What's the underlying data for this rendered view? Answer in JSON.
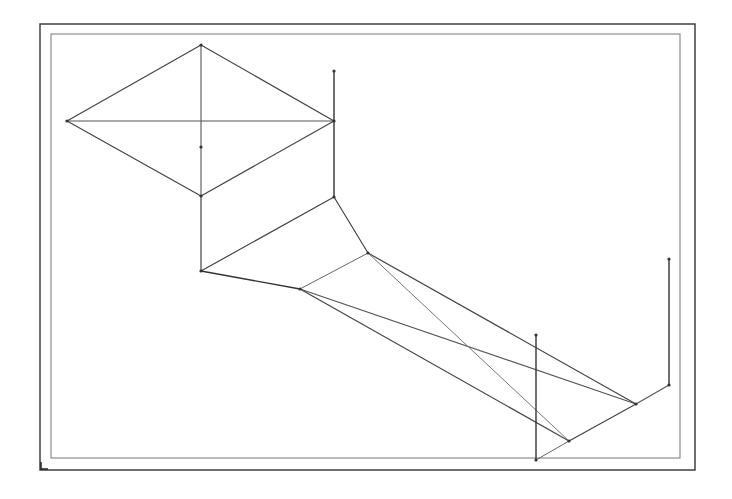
{
  "diagram": {
    "type": "line-drawing",
    "frames": {
      "outer": {
        "x1": 40,
        "y1": 24,
        "x2": 695,
        "y2": 470,
        "stroke": "#333333",
        "width": 1.4
      },
      "inner": {
        "x1": 51,
        "y1": 34,
        "x2": 680,
        "y2": 458,
        "stroke": "#777777",
        "width": 1
      }
    },
    "nodes": [
      {
        "id": "diamond-left",
        "x": 67,
        "y": 121
      },
      {
        "id": "diamond-top",
        "x": 201,
        "y": 45
      },
      {
        "id": "diamond-right",
        "x": 334,
        "y": 121
      },
      {
        "id": "diamond-bottom",
        "x": 201,
        "y": 196
      },
      {
        "id": "diamond-center",
        "x": 201,
        "y": 147
      },
      {
        "id": "post-top",
        "x": 334,
        "y": 71
      },
      {
        "id": "post-bottom",
        "x": 334,
        "y": 197
      },
      {
        "id": "node-a",
        "x": 201,
        "y": 271
      },
      {
        "id": "node-b",
        "x": 300,
        "y": 289
      },
      {
        "id": "node-d",
        "x": 368,
        "y": 253
      },
      {
        "id": "node-e",
        "x": 536,
        "y": 335
      },
      {
        "id": "node-f",
        "x": 536,
        "y": 460
      },
      {
        "id": "node-g",
        "x": 569,
        "y": 441
      },
      {
        "id": "node-h",
        "x": 636,
        "y": 404
      },
      {
        "id": "node-i",
        "x": 669,
        "y": 385
      },
      {
        "id": "node-j",
        "x": 669,
        "y": 259
      }
    ],
    "edges": [
      {
        "from": "diamond-left",
        "to": "diamond-top",
        "stroke": "#444444",
        "width": 1.2
      },
      {
        "from": "diamond-top",
        "to": "diamond-right",
        "stroke": "#444444",
        "width": 1.2
      },
      {
        "from": "diamond-right",
        "to": "diamond-bottom",
        "stroke": "#444444",
        "width": 1.2
      },
      {
        "from": "diamond-bottom",
        "to": "diamond-left",
        "stroke": "#444444",
        "width": 1.2
      },
      {
        "from": "diamond-left",
        "to": "diamond-right",
        "stroke": "#555555",
        "width": 1.1
      },
      {
        "from": "diamond-top",
        "to": "diamond-bottom",
        "stroke": "#555555",
        "width": 1.1
      },
      {
        "from": "post-top",
        "to": "post-bottom",
        "stroke": "#333333",
        "width": 1.4
      },
      {
        "from": "diamond-bottom",
        "to": "node-a",
        "stroke": "#444444",
        "width": 1.2
      },
      {
        "from": "node-a",
        "to": "post-bottom",
        "stroke": "#444444",
        "width": 1.2
      },
      {
        "from": "post-bottom",
        "to": "node-d",
        "stroke": "#444444",
        "width": 1.2
      },
      {
        "from": "node-a",
        "to": "node-b",
        "stroke": "#333333",
        "width": 1.4
      },
      {
        "from": "node-b",
        "to": "node-d",
        "stroke": "#666666",
        "width": 1
      },
      {
        "from": "node-b",
        "to": "node-h",
        "stroke": "#555555",
        "width": 1.1
      },
      {
        "from": "node-b",
        "to": "node-g",
        "stroke": "#444444",
        "width": 1.2
      },
      {
        "from": "node-d",
        "to": "node-h",
        "stroke": "#444444",
        "width": 1.2
      },
      {
        "from": "node-d",
        "to": "node-g",
        "stroke": "#777777",
        "width": 1
      },
      {
        "from": "node-f",
        "to": "node-g",
        "stroke": "#666666",
        "width": 1
      },
      {
        "from": "node-g",
        "to": "node-h",
        "stroke": "#444444",
        "width": 1.2
      },
      {
        "from": "node-h",
        "to": "node-i",
        "stroke": "#555555",
        "width": 1.1
      },
      {
        "from": "node-i",
        "to": "node-j",
        "stroke": "#333333",
        "width": 1.4
      },
      {
        "from": "node-e",
        "to": "node-f",
        "stroke": "#333333",
        "width": 1.4
      }
    ],
    "node_style": {
      "radius": 1.6,
      "fill": "#333333"
    },
    "background": "#ffffff"
  }
}
